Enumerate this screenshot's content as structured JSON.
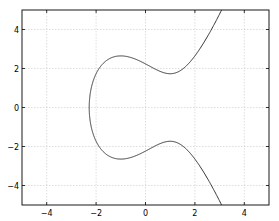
{
  "chart_data": {
    "type": "line",
    "title": "",
    "xlabel": "",
    "ylabel": "",
    "equation": "y^2 = x^3 - 3x + 5",
    "xlim": [
      -5,
      5
    ],
    "ylim": [
      -5,
      5
    ],
    "grid": true,
    "legend": null,
    "xticks": [
      -4,
      -2,
      0,
      2,
      4
    ],
    "yticks": [
      -4,
      -2,
      0,
      2,
      4
    ],
    "xtick_labels": [
      "−4",
      "−2",
      "0",
      "2",
      "4"
    ],
    "ytick_labels": [
      "−4",
      "−2",
      "0",
      "2",
      "4"
    ],
    "series": [
      {
        "name": "elliptic-curve",
        "color": "#333333",
        "points": [
          [
            2.98,
            5.0
          ],
          [
            2.7,
            4.3
          ],
          [
            2.4,
            3.65
          ],
          [
            2.1,
            3.05
          ],
          [
            1.8,
            2.55
          ],
          [
            1.5,
            2.15
          ],
          [
            1.2,
            1.87
          ],
          [
            1.0,
            1.73
          ],
          [
            0.7,
            1.76
          ],
          [
            0.4,
            1.98
          ],
          [
            0.0,
            2.24
          ],
          [
            -0.5,
            2.52
          ],
          [
            -1.0,
            2.65
          ],
          [
            -1.4,
            2.56
          ],
          [
            -1.8,
            2.14
          ],
          [
            -2.0,
            1.73
          ],
          [
            -2.15,
            1.14
          ],
          [
            -2.25,
            0.5
          ],
          [
            -2.28,
            0.0
          ],
          [
            -2.25,
            -0.5
          ],
          [
            -2.15,
            -1.14
          ],
          [
            -2.0,
            -1.73
          ],
          [
            -1.8,
            -2.14
          ],
          [
            -1.4,
            -2.56
          ],
          [
            -1.0,
            -2.65
          ],
          [
            -0.5,
            -2.52
          ],
          [
            0.0,
            -2.24
          ],
          [
            0.4,
            -1.98
          ],
          [
            0.7,
            -1.76
          ],
          [
            1.0,
            -1.73
          ],
          [
            1.2,
            -1.87
          ],
          [
            1.5,
            -2.15
          ],
          [
            1.8,
            -2.55
          ],
          [
            2.1,
            -3.05
          ],
          [
            2.4,
            -3.65
          ],
          [
            2.7,
            -4.3
          ],
          [
            2.98,
            -5.0
          ]
        ]
      }
    ]
  }
}
